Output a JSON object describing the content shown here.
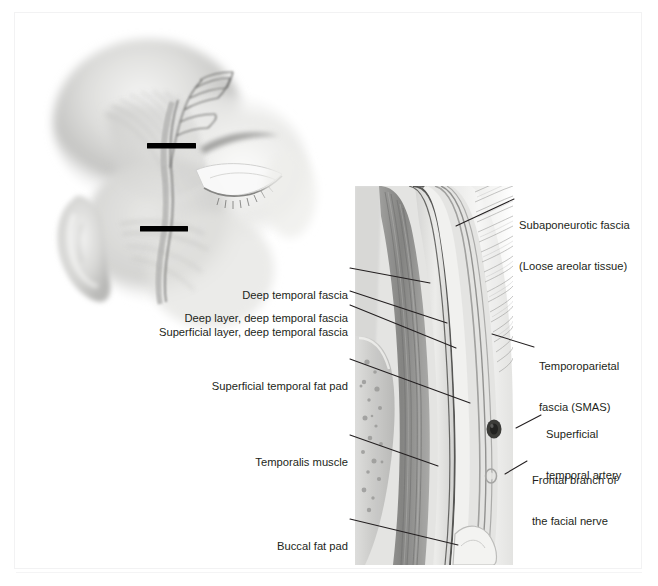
{
  "figure": {
    "background_color": "#ffffff",
    "ink_color": "#231f20"
  },
  "panels": {
    "head_illustration": {
      "name": "lateral-oblique-head-illustration",
      "description": "Grayscale three-quarter view of a head showing the temporal region with the frontal branch of the facial nerve and superficial temporal artery traced over the temporalis; two black bars mark the levels of section.",
      "section_markers": [
        {
          "label": "upper-section-level"
        },
        {
          "label": "lower-section-level"
        }
      ]
    },
    "cross_section": {
      "name": "temporal-region-cross-section",
      "description": "Grayscale histologic cross-section through the temporal region showing skin with hair follicles, temporoparietal fascia, subaponeurotic loose areolar plane, superficial and deep layers of deep temporal fascia with intervening superficial temporal fat pad, temporalis muscle, skull and buccal fat pad."
    }
  },
  "labels": {
    "deep_temporal_fascia": {
      "lines": [
        "Deep temporal fascia"
      ],
      "side": "left"
    },
    "deep_layer_deep_temporal_fascia": {
      "lines": [
        "Deep layer, deep temporal fascia"
      ],
      "side": "left"
    },
    "superficial_layer_deep_temporal_fascia": {
      "lines": [
        "Superficial layer, deep temporal fascia"
      ],
      "side": "left"
    },
    "superficial_temporal_fat_pad": {
      "lines": [
        "Superficial temporal fat pad"
      ],
      "side": "left"
    },
    "temporalis_muscle": {
      "lines": [
        "Temporalis muscle"
      ],
      "side": "left"
    },
    "buccal_fat_pad": {
      "lines": [
        "Buccal fat pad"
      ],
      "side": "left"
    },
    "subaponeurotic_fascia": {
      "lines": [
        "Subaponeurotic fascia",
        "(Loose areolar tissue)"
      ],
      "side": "right"
    },
    "temporoparietal_fascia": {
      "lines": [
        "Temporoparietal",
        "fascia (SMAS)"
      ],
      "side": "right"
    },
    "superficial_temporal_artery": {
      "lines": [
        "Superficial",
        "temporal artery"
      ],
      "side": "right"
    },
    "frontal_branch_facial_nerve": {
      "lines": [
        "Frontal branch of",
        "the facial nerve"
      ],
      "side": "right"
    }
  }
}
